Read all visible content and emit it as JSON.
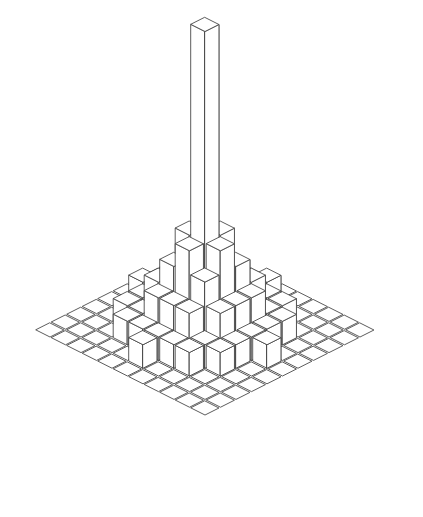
{
  "figure": {
    "title": "",
    "caption": "",
    "style": "pen-and-ink isometric line drawing",
    "background_color": "#ffffff",
    "line_color": "#4a4a4a",
    "hatch_color": "#9a9a9a",
    "face_fill_color": "#ffffff"
  },
  "chart_data": {
    "type": "bar",
    "subtype": "3d-isometric-bar-histogram",
    "title": "",
    "subtitle": "",
    "xlabel": "",
    "ylabel": "",
    "zlabel": "",
    "xticklabels": [],
    "yticklabels": [],
    "zticklabels": [],
    "grid": false,
    "legend": null,
    "annotations": [],
    "projection": {
      "kind": "isometric",
      "cell_half_width_px": 15.5,
      "cell_half_depth_px": 7.8,
      "unit_height_px": 23.5,
      "origin_x_px": 205,
      "origin_y_px": 330
    },
    "nx": 11,
    "ny": 11,
    "x": [
      -5,
      -4,
      -3,
      -2,
      -1,
      0,
      1,
      2,
      3,
      4,
      5
    ],
    "y": [
      -5,
      -4,
      -3,
      -2,
      -1,
      0,
      1,
      2,
      3,
      4,
      5
    ],
    "zlim": [
      0,
      13
    ],
    "values": [
      [
        0,
        0,
        0,
        0,
        0,
        0,
        0,
        0,
        0,
        0,
        0
      ],
      [
        0,
        0,
        0,
        0,
        0,
        1,
        0,
        0,
        0,
        0,
        0
      ],
      [
        0,
        0,
        0,
        1,
        1,
        1,
        1,
        1,
        0,
        0,
        0
      ],
      [
        0,
        0,
        1,
        1,
        2,
        2,
        2,
        1,
        1,
        0,
        0
      ],
      [
        0,
        0,
        1,
        2,
        3,
        4,
        3,
        2,
        1,
        0,
        0
      ],
      [
        0,
        1,
        1,
        2,
        4,
        13,
        4,
        2,
        1,
        1,
        0
      ],
      [
        0,
        0,
        1,
        2,
        3,
        4,
        3,
        2,
        1,
        0,
        0
      ],
      [
        0,
        0,
        1,
        1,
        2,
        2,
        2,
        1,
        1,
        0,
        0
      ],
      [
        0,
        0,
        0,
        1,
        1,
        1,
        1,
        1,
        0,
        0,
        0
      ],
      [
        0,
        0,
        0,
        0,
        0,
        1,
        0,
        0,
        0,
        0,
        0
      ],
      [
        0,
        0,
        0,
        0,
        0,
        0,
        0,
        0,
        0,
        0,
        0
      ]
    ],
    "peak_value": 13,
    "peak_cell": [
      5,
      5
    ]
  }
}
